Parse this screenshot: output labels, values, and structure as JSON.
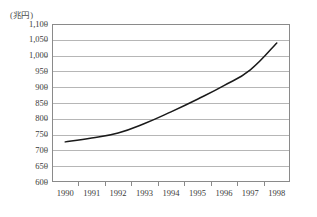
{
  "chart_data": {
    "type": "line",
    "title": "",
    "subtitle": "",
    "unit_label": "(兆円)",
    "xlabel": "",
    "ylabel": "",
    "categories": [
      "1990",
      "1991",
      "1992",
      "1993",
      "1994",
      "1995",
      "1996",
      "1997",
      "1998"
    ],
    "x": [
      1990,
      1991,
      1992,
      1993,
      1994,
      1995,
      1996,
      1997,
      1998
    ],
    "values": [
      727,
      739,
      755,
      785,
      822,
      862,
      905,
      955,
      1040
    ],
    "series": [
      {
        "name": "",
        "values": [
          727,
          739,
          755,
          785,
          822,
          862,
          905,
          955,
          1040
        ]
      }
    ],
    "ylim": [
      600,
      1100
    ],
    "yticks": [
      600,
      650,
      700,
      750,
      800,
      850,
      900,
      950,
      1000,
      1050,
      1100
    ],
    "ytick_labels": [
      "600",
      "650",
      "700",
      "750",
      "800",
      "850",
      "900",
      "950",
      "1,000",
      "1,050",
      "1,100"
    ],
    "xtick_labels": [
      "1990",
      "1991",
      "1992",
      "1993",
      "1994",
      "1995",
      "1996",
      "1997",
      "1998"
    ],
    "grid": true,
    "grid_axis": "y",
    "legend": false,
    "legend_position": "none",
    "line_color": "#1a1a1a",
    "grid_color": "#b6b6b6",
    "axis_color": "#8a8a8a",
    "background_color": "#ffffff"
  }
}
